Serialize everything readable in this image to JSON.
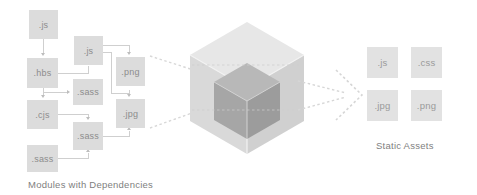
{
  "diagram": {
    "title_left": "Modules with Dependencies",
    "title_right": "Static Assets",
    "colors": {
      "module_fill": "#dcdcdc",
      "asset_fill": "#e2e2e2",
      "module_text": "#8c8c8c",
      "asset_text": "#9a9a9a",
      "connector": "#cfcfcf",
      "arrow": "#bdbdbd",
      "cube_outer_light": "#e6e6e6",
      "cube_outer_mid": "#dadada",
      "cube_outer_dark": "#cfcfcf",
      "cube_inner_light": "#b4b4b4",
      "cube_inner_mid": "#a8a8a8",
      "cube_inner_dark": "#9b9b9b",
      "dashed": "#d6d6d6",
      "background": "#ffffff"
    },
    "modules": [
      {
        "label": ".js",
        "x": 29,
        "y": 10,
        "w": 29,
        "h": 29
      },
      {
        "label": ".js",
        "x": 74,
        "y": 36,
        "w": 29,
        "h": 29
      },
      {
        "label": ".hbs",
        "x": 27,
        "y": 58,
        "w": 31,
        "h": 30
      },
      {
        "label": ".png",
        "x": 116,
        "y": 57,
        "w": 29,
        "h": 29
      },
      {
        "label": ".sass",
        "x": 73,
        "y": 79,
        "w": 30,
        "h": 26
      },
      {
        "label": ".cjs",
        "x": 27,
        "y": 100,
        "w": 31,
        "h": 29
      },
      {
        "label": ".jpg",
        "x": 116,
        "y": 99,
        "w": 29,
        "h": 29
      },
      {
        "label": ".sass",
        "x": 73,
        "y": 122,
        "w": 30,
        "h": 28
      },
      {
        "label": ".sass",
        "x": 27,
        "y": 145,
        "w": 31,
        "h": 27
      }
    ],
    "assets": [
      {
        "label": ".js",
        "x": 367,
        "y": 47,
        "w": 31,
        "h": 31
      },
      {
        "label": ".css",
        "x": 411,
        "y": 47,
        "w": 31,
        "h": 31
      },
      {
        "label": ".jpg",
        "x": 367,
        "y": 90,
        "w": 31,
        "h": 31
      },
      {
        "label": ".png",
        "x": 411,
        "y": 90,
        "w": 31,
        "h": 31
      }
    ],
    "cube": {
      "description": "isometric hexagon cube with smaller dark cube nested inside",
      "outer_faces": 3,
      "inner_faces": 3
    },
    "flow": {
      "inbound_lines": 2,
      "outbound_arrow": 1,
      "style": "dashed"
    }
  }
}
